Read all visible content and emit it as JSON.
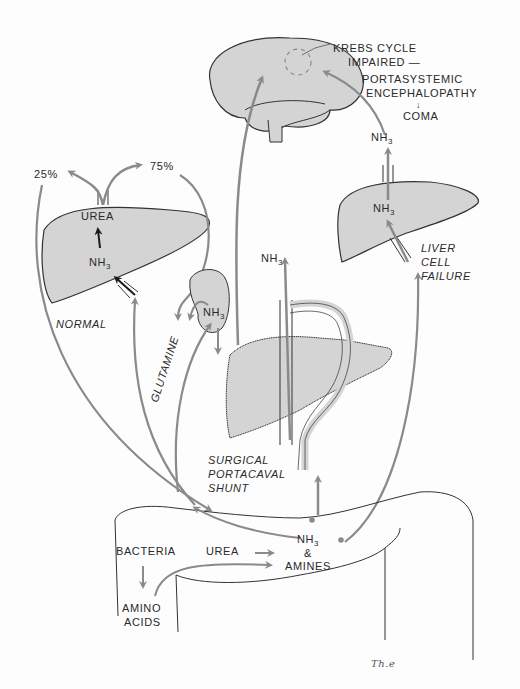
{
  "colors": {
    "organ_fill": "#d4d4d4",
    "outline": "#333333",
    "arrow_gray": "#8a8a8a",
    "arrow_black": "#1a1a1a",
    "background": "#fdfdfd"
  },
  "brain": {
    "krebs_line1": "KREBS CYCLE",
    "krebs_line2": "IMPAIRED —",
    "encephalopathy_line1": "PORTASYSTEMIC",
    "encephalopathy_line2": "ENCEPHALOPATHY",
    "arrow_down": "↓",
    "coma": "COMA"
  },
  "normal_liver": {
    "percent_left": "25%",
    "percent_right": "75%",
    "urea": "UREA",
    "nh3": "NH",
    "nh3_sub": "3",
    "caption": "NORMAL"
  },
  "kidney": {
    "nh3": "NH",
    "nh3_sub": "3",
    "glutamine": "GLUTAMINE"
  },
  "shunt": {
    "nh3": "NH",
    "nh3_sub": "3",
    "caption_line1": "SURGICAL",
    "caption_line2": "PORTACAVAL",
    "caption_line3": "SHUNT"
  },
  "failure_liver": {
    "nh3_top": "NH",
    "nh3_top_sub": "3",
    "nh3_inner": "NH",
    "nh3_inner_sub": "3",
    "caption_line1": "LIVER",
    "caption_line2": "CELL",
    "caption_line3": "FAILURE"
  },
  "colon": {
    "bacteria": "BACTERIA",
    "urea": "UREA",
    "nh3": "NH",
    "nh3_sub": "3",
    "ampersand": "&",
    "amines": "AMINES",
    "amino": "AMINO",
    "acids": "ACIDS"
  },
  "signature": "Th.e"
}
